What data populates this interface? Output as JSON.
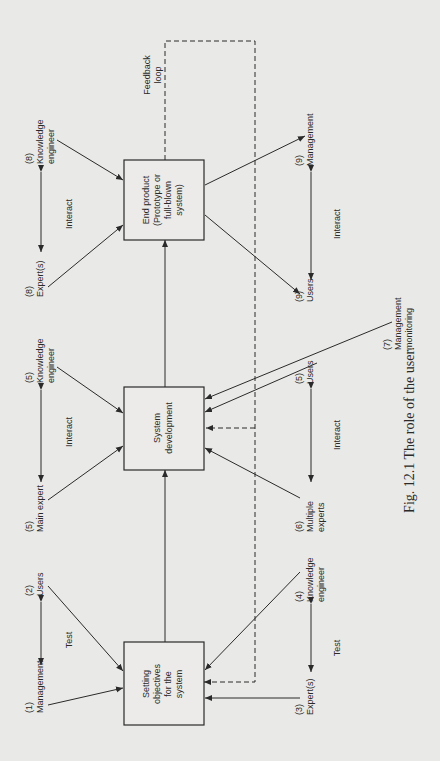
{
  "figure": {
    "caption": "Fig. 12.1   The role of the user.",
    "boxes": {
      "objectives": [
        "Setting",
        "objectives",
        "for the",
        "system"
      ],
      "development": [
        "System",
        "development"
      ],
      "end_product": [
        "End product",
        "(Prototype or",
        "full-blown",
        "system)"
      ]
    },
    "feedback": [
      "Feedback",
      "loop"
    ],
    "participants": {
      "p1": {
        "num": "(1)",
        "name": [
          "Management"
        ]
      },
      "p2": {
        "num": "(2)",
        "name": [
          "Users"
        ]
      },
      "p3": {
        "num": "(3)",
        "name": [
          "Expert(s)"
        ]
      },
      "p4": {
        "num": "(4)",
        "name": [
          "Knowledge",
          "engineer"
        ]
      },
      "p5a": {
        "num": "(5)",
        "name": [
          "Main expert"
        ]
      },
      "p5b": {
        "num": "(5)",
        "name": [
          "Knowledge",
          "engineer"
        ]
      },
      "p5c": {
        "num": "(5)",
        "name": [
          "Users"
        ]
      },
      "p6": {
        "num": "(6)",
        "name": [
          "Multiple",
          "experts"
        ]
      },
      "p7": {
        "num": "(7)",
        "name": [
          "Management",
          "monitoring"
        ]
      },
      "p8a": {
        "num": "(8)",
        "name": [
          "Expert(s)"
        ]
      },
      "p8b": {
        "num": "(8)",
        "name": [
          "Knowledge",
          "engineer"
        ]
      },
      "p9a": {
        "num": "(9)",
        "name": [
          "Users"
        ]
      },
      "p9b": {
        "num": "(9)",
        "name": [
          "Management"
        ]
      }
    },
    "relations": {
      "test_top": "Test",
      "test_bottom": "Test",
      "interact_dev_top": "Interact",
      "interact_dev_bottom": "Interact",
      "interact_end_top": "Interact",
      "interact_end_bottom": "Interact"
    }
  }
}
